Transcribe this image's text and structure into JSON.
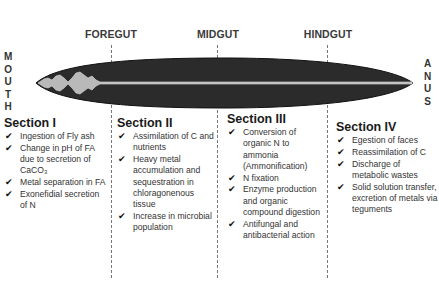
{
  "diagram": {
    "colors": {
      "gut_body": "#2b2b2b",
      "gut_lumen": "#b8b8b8",
      "divider": "#777777",
      "text": "#222222"
    },
    "regions": [
      {
        "label": "FOREGUT"
      },
      {
        "label": "MIDGUT"
      },
      {
        "label": "HINDGUT"
      }
    ],
    "ends": {
      "left": {
        "label": "MOUTH",
        "letters": [
          "M",
          "O",
          "U",
          "T",
          "H"
        ]
      },
      "right": {
        "label": "ANUS",
        "letters": [
          "A",
          "N",
          "U",
          "S"
        ]
      }
    },
    "sections": [
      {
        "title": "Section I",
        "items": [
          "Ingestion of Fly ash",
          "Change in pH of FA due to secretion of CaCO₃",
          "Metal separation in FA",
          "Exonefidial secretion of N"
        ]
      },
      {
        "title": "Section II",
        "items": [
          "Assimilation of C and nutrients",
          "Heavy metal accumulation and sequestration  in chloragonenous tissue",
          "Increase in microbial population"
        ]
      },
      {
        "title": "Section III",
        "items": [
          "Conversion of organic N to ammonia (Ammonification)",
          "N fixation",
          "Enzyme production and organic compound digestion",
          "Antifungal and antibacterial action"
        ]
      },
      {
        "title": "Section IV",
        "items": [
          "Egestion of faces",
          "Reassimilation of C",
          "Discharge of metabolic wastes",
          "Solid solution transfer, excretion of metals via teguments"
        ]
      }
    ],
    "check_icon": "✔"
  }
}
